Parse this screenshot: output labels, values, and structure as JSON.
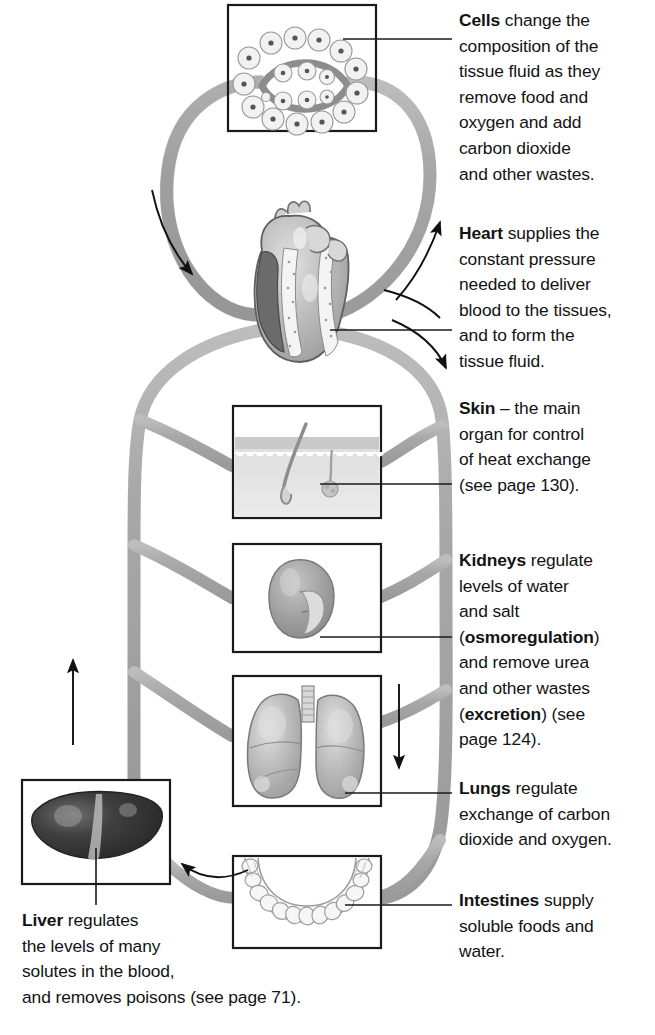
{
  "colors": {
    "vessel_fill": "#a9a9a9",
    "vessel_stroke": "#8d8d8d",
    "box_stroke": "#1a1a1a",
    "text": "#131313",
    "organ_light": "#c9c9c9",
    "organ_mid": "#a5a5a5",
    "organ_dark": "#3a3a3a",
    "background": "#ffffff"
  },
  "boxes": [
    {
      "id": "cells",
      "name": "cells-box",
      "x": 228,
      "y": 5,
      "w": 148,
      "h": 126
    },
    {
      "id": "skin",
      "name": "skin-box",
      "x": 233,
      "y": 406,
      "w": 148,
      "h": 112
    },
    {
      "id": "kidneys",
      "name": "kidneys-box",
      "x": 233,
      "y": 544,
      "w": 148,
      "h": 108
    },
    {
      "id": "lungs",
      "name": "lungs-box",
      "x": 233,
      "y": 676,
      "w": 148,
      "h": 130
    },
    {
      "id": "intestines",
      "name": "intestines-box",
      "x": 233,
      "y": 856,
      "w": 148,
      "h": 92
    },
    {
      "id": "liver",
      "name": "liver-box",
      "x": 22,
      "y": 780,
      "w": 148,
      "h": 104
    }
  ],
  "organs": [
    {
      "id": "cells",
      "label": "Cells",
      "icon": "capillary-with-cells-icon"
    },
    {
      "id": "heart",
      "label": "Heart",
      "icon": "heart-organ-icon"
    },
    {
      "id": "skin",
      "label": "Skin",
      "icon": "skin-cross-section-icon"
    },
    {
      "id": "kidneys",
      "label": "Kidneys",
      "icon": "kidney-organ-icon"
    },
    {
      "id": "lungs",
      "label": "Lungs",
      "icon": "lungs-organ-icon"
    },
    {
      "id": "intestines",
      "label": "Intestines",
      "icon": "intestines-organ-icon"
    },
    {
      "id": "liver",
      "label": "Liver",
      "icon": "liver-organ-icon"
    }
  ],
  "callouts": {
    "cells": {
      "lead": "Cells",
      "body": " change the\ncomposition of the\ntissue fluid as they\nremove food and\noxygen and add\ncarbon dioxide\nand other wastes."
    },
    "heart": {
      "lead": "Heart",
      "body": " supplies the\nconstant pressure\nneeded to deliver\nblood to the tissues,\nand to form the\ntissue fluid."
    },
    "skin": {
      "lead": "Skin",
      "body": " – the main\norgan for control\nof heat exchange\n(see page 130)."
    },
    "kidneys": {
      "lead": "Kidneys",
      "part1": " regulate\nlevels of water\nand salt\n(",
      "bold1": "osmoregulation",
      "part2": ")\nand remove urea\nand other wastes\n(",
      "bold2": "excretion",
      "part3": ") (see\npage 124)."
    },
    "lungs": {
      "lead": "Lungs",
      "body": " regulate\nexchange of carbon\ndioxide and oxygen."
    },
    "intestines": {
      "lead": "Intestines",
      "body": " supply\nsoluble foods and\nwater."
    },
    "liver": {
      "lead": "Liver",
      "body": " regulates\nthe levels of many\nsolutes in the blood,\nand removes poisons (see page 71)."
    }
  },
  "page_references": {
    "skin": "130",
    "kidneys": "124",
    "liver": "71"
  },
  "flow_arrows": [
    {
      "id": "arrow-to-cells-left",
      "name": "blood-flow-arrow-left-down",
      "direction": "down-right"
    },
    {
      "id": "arrow-from-cells",
      "name": "blood-flow-arrow-right-up",
      "direction": "up-right"
    },
    {
      "id": "arrow-heart-out",
      "name": "blood-flow-arrow-heart-out",
      "direction": "down-right"
    },
    {
      "id": "arrow-right-down",
      "name": "blood-flow-arrow-descending",
      "direction": "down"
    },
    {
      "id": "arrow-liver-up",
      "name": "blood-flow-arrow-liver-up",
      "direction": "up"
    },
    {
      "id": "arrow-portal-vein",
      "name": "hepatic-portal-vein-arrow",
      "direction": "left"
    }
  ]
}
